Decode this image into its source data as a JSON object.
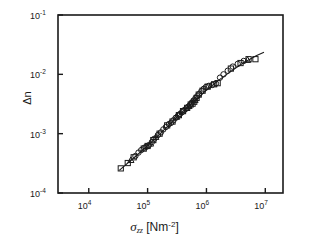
{
  "figure": {
    "background_color": "#ffffff",
    "frame_color": "#1a1a1a",
    "marker_color": "#1a1a1a",
    "line_color": "#1a1a1a"
  },
  "axes": {
    "x": {
      "label_symbol": "σ",
      "label_subscript": "zz",
      "label_units_open": "[Nm",
      "label_units_exp": "-2",
      "label_units_close": "]",
      "label_full": "σzz [Nm -2 ]",
      "ticks": [
        {
          "value": 10000,
          "mantissa": "10",
          "exponent": "4"
        },
        {
          "value": 100000,
          "mantissa": "10",
          "exponent": "5"
        },
        {
          "value": 1000000,
          "mantissa": "10",
          "exponent": "6"
        },
        {
          "value": 10000000,
          "mantissa": "10",
          "exponent": "7"
        }
      ]
    },
    "y": {
      "label_full": "Δn",
      "ticks": [
        {
          "value": 0.1,
          "mantissa": "10",
          "exponent": "-1"
        },
        {
          "value": 0.01,
          "mantissa": "10",
          "exponent": "-2"
        },
        {
          "value": 0.001,
          "mantissa": "10",
          "exponent": "-3"
        },
        {
          "value": 0.0001,
          "mantissa": "10",
          "exponent": "-4"
        }
      ]
    }
  },
  "chart_data": {
    "type": "scatter",
    "title": "",
    "xlabel": "σzz [Nm -2 ]",
    "ylabel": "Δn",
    "xscale": "log",
    "yscale": "log",
    "xlim": [
      3000,
      20000000
    ],
    "ylim": [
      0.0001,
      0.1
    ],
    "grid": false,
    "legend": "none",
    "series": [
      {
        "name": "circles",
        "marker": "open-circle",
        "points": [
          [
            62000,
            0.00042
          ],
          [
            70000,
            0.00048
          ],
          [
            78000,
            0.00053
          ],
          [
            88000,
            0.00058
          ],
          [
            95000,
            0.0006
          ],
          [
            105000,
            0.00064
          ],
          [
            118000,
            0.00072
          ],
          [
            130000,
            0.00082
          ],
          [
            150000,
            0.00095
          ],
          [
            168000,
            0.00105
          ],
          [
            185000,
            0.00118
          ],
          [
            205000,
            0.0013
          ],
          [
            230000,
            0.00145
          ],
          [
            250000,
            0.00152
          ],
          [
            275000,
            0.00168
          ],
          [
            300000,
            0.00185
          ],
          [
            330000,
            0.002
          ],
          [
            355000,
            0.00215
          ],
          [
            385000,
            0.0023
          ],
          [
            420000,
            0.0025
          ],
          [
            455000,
            0.00265
          ],
          [
            490000,
            0.00285
          ],
          [
            520000,
            0.003
          ],
          [
            560000,
            0.0033
          ],
          [
            600000,
            0.0036
          ],
          [
            650000,
            0.00395
          ],
          [
            700000,
            0.0043
          ],
          [
            760000,
            0.0047
          ],
          [
            820000,
            0.0052
          ],
          [
            900000,
            0.0057
          ],
          [
            980000,
            0.0061
          ],
          [
            1100000,
            0.0064
          ],
          [
            1250000,
            0.0066
          ],
          [
            1450000,
            0.007
          ],
          [
            1700000,
            0.0088
          ],
          [
            1950000,
            0.01
          ],
          [
            2300000,
            0.0115
          ],
          [
            2800000,
            0.0135
          ],
          [
            3400000,
            0.015
          ],
          [
            4300000,
            0.0168
          ]
        ]
      },
      {
        "name": "squares",
        "marker": "open-square",
        "points": [
          [
            35000,
            0.00026
          ],
          [
            46000,
            0.00032
          ],
          [
            58000,
            0.0004
          ],
          [
            86000,
            0.00056
          ],
          [
            100000,
            0.00062
          ],
          [
            125000,
            0.00078
          ],
          [
            160000,
            0.001
          ],
          [
            215000,
            0.00138
          ],
          [
            265000,
            0.0016
          ],
          [
            340000,
            0.00205
          ],
          [
            400000,
            0.0024
          ],
          [
            470000,
            0.00272
          ],
          [
            540000,
            0.0031
          ],
          [
            580000,
            0.0032
          ],
          [
            620000,
            0.00345
          ],
          [
            680000,
            0.004
          ],
          [
            740000,
            0.00455
          ],
          [
            860000,
            0.0053
          ],
          [
            1050000,
            0.0062
          ],
          [
            1350000,
            0.0068
          ],
          [
            1550000,
            0.0071
          ],
          [
            2600000,
            0.0125
          ],
          [
            3800000,
            0.0155
          ],
          [
            5200000,
            0.018
          ],
          [
            6800000,
            0.018
          ]
        ]
      },
      {
        "name": "triangles",
        "marker": "open-triangle",
        "points": [
          [
            52000,
            0.00036
          ],
          [
            112000,
            0.00068
          ],
          [
            138000,
            0.00088
          ],
          [
            310000,
            0.00192
          ],
          [
            505000,
            0.00292
          ],
          [
            640000,
            0.0037
          ],
          [
            5000000,
            0.0175
          ]
        ]
      }
    ],
    "fit_line": {
      "name": "guide line",
      "style": "solid",
      "points": [
        [
          33000,
          0.00024
        ],
        [
          60000,
          0.0004
        ],
        [
          110000,
          0.00068
        ],
        [
          200000,
          0.00122
        ],
        [
          360000,
          0.00215
        ],
        [
          620000,
          0.0035
        ],
        [
          1000000,
          0.0054
        ],
        [
          1600000,
          0.0079
        ],
        [
          2600000,
          0.0112
        ],
        [
          4200000,
          0.0155
        ],
        [
          7000000,
          0.0205
        ],
        [
          9500000,
          0.0235
        ]
      ]
    }
  }
}
